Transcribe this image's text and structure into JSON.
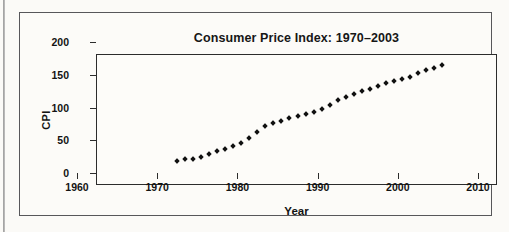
{
  "figure": {
    "title": "Consumer Price Index: 1970–2003"
  },
  "chart_data": {
    "type": "scatter",
    "title": "Consumer Price Index: 1970–2003",
    "xlabel": "Year",
    "ylabel": "CPI",
    "xlim": [
      1960,
      2010
    ],
    "ylim": [
      0,
      200
    ],
    "xticks": [
      1960,
      1970,
      1980,
      1990,
      2000,
      2010
    ],
    "yticks": [
      0,
      50,
      100,
      150,
      200
    ],
    "xtick_labels": [
      "1960",
      "1970",
      "1980",
      "1990",
      "2000",
      "2010"
    ],
    "ytick_labels": [
      "0",
      "50",
      "100",
      "150",
      "200"
    ],
    "grid": false,
    "legend": "none",
    "marker": "filled-diamond",
    "marker_color": "#111111",
    "series": [
      {
        "name": "CPI",
        "x": [
          1970,
          1971,
          1972,
          1973,
          1974,
          1975,
          1976,
          1977,
          1978,
          1979,
          1980,
          1981,
          1982,
          1983,
          1984,
          1985,
          1986,
          1987,
          1988,
          1989,
          1990,
          1991,
          1992,
          1993,
          1994,
          1995,
          1996,
          1997,
          1998,
          1999,
          2000,
          2001,
          2002,
          2003
        ],
        "values": [
          38.8,
          40.5,
          41.8,
          44.4,
          49.3,
          53.8,
          56.9,
          60.6,
          65.2,
          72.6,
          82.4,
          90.9,
          96.5,
          99.6,
          103.9,
          107.6,
          109.6,
          113.6,
          118.3,
          124.0,
          130.7,
          136.2,
          140.3,
          144.5,
          148.2,
          152.4,
          156.9,
          160.5,
          163.0,
          166.6,
          172.2,
          177.1,
          179.9,
          184.0
        ]
      }
    ]
  }
}
